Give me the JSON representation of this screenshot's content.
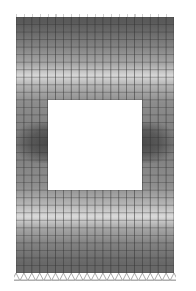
{
  "figure": {
    "mesh": {
      "columns": 20,
      "rows": 34,
      "hole": {
        "col_start": 4,
        "col_end": 16,
        "row_start": 11,
        "row_end": 23
      }
    },
    "contour_bands": [
      {
        "from": 0.0,
        "to": 0.04,
        "shade": "#5a5a5a"
      },
      {
        "from": 0.04,
        "to": 0.1,
        "shade": "#6e6e6e"
      },
      {
        "from": 0.1,
        "to": 0.16,
        "shade": "#8a8a8a"
      },
      {
        "from": 0.16,
        "to": 0.21,
        "shade": "#a8a8a8"
      },
      {
        "from": 0.21,
        "to": 0.25,
        "shade": "#d8d8d8"
      },
      {
        "from": 0.25,
        "to": 0.29,
        "shade": "#b0b0b0"
      },
      {
        "from": 0.29,
        "to": 0.38,
        "shade": "#8c8c8c"
      },
      {
        "from": 0.38,
        "to": 0.62,
        "shade": "#7c7c7c"
      },
      {
        "from": 0.62,
        "to": 0.7,
        "shade": "#8e8e8e"
      },
      {
        "from": 0.7,
        "to": 0.76,
        "shade": "#b4b4b4"
      },
      {
        "from": 0.76,
        "to": 0.8,
        "shade": "#dadada"
      },
      {
        "from": 0.8,
        "to": 0.85,
        "shade": "#a6a6a6"
      },
      {
        "from": 0.85,
        "to": 0.92,
        "shade": "#828282"
      },
      {
        "from": 0.92,
        "to": 1.0,
        "shade": "#686868"
      }
    ],
    "side_blobs_shade": "#4a4a4a",
    "grid_line_color": "#333333",
    "support_color": "#888888",
    "support_count": 20
  }
}
